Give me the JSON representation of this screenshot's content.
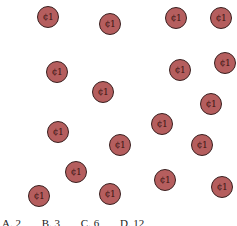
{
  "coin": {
    "label": "¢1",
    "fill": "#b55e5e",
    "border": "#3a2020"
  },
  "coins": [
    {
      "x": 48,
      "y": 17
    },
    {
      "x": 110,
      "y": 24
    },
    {
      "x": 176,
      "y": 18
    },
    {
      "x": 221,
      "y": 18
    },
    {
      "x": 57,
      "y": 72
    },
    {
      "x": 103,
      "y": 92
    },
    {
      "x": 180,
      "y": 70
    },
    {
      "x": 225,
      "y": 63
    },
    {
      "x": 211,
      "y": 104
    },
    {
      "x": 58,
      "y": 132
    },
    {
      "x": 162,
      "y": 124
    },
    {
      "x": 120,
      "y": 145
    },
    {
      "x": 202,
      "y": 145
    },
    {
      "x": 76,
      "y": 172
    },
    {
      "x": 39,
      "y": 196
    },
    {
      "x": 110,
      "y": 194
    },
    {
      "x": 165,
      "y": 180
    },
    {
      "x": 222,
      "y": 187
    }
  ],
  "options": [
    "A. 2",
    "B. 3",
    "C. 6",
    "D. 12"
  ]
}
